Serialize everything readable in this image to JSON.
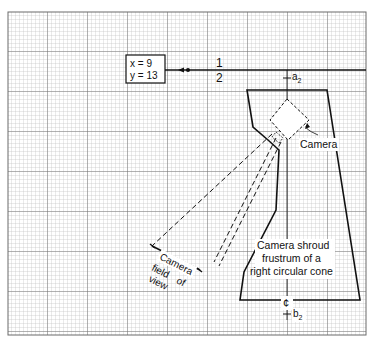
{
  "diagram": {
    "coord_box": {
      "x_label": "x = 9",
      "y_label": "y = 13"
    },
    "fraction": {
      "numerator": "1",
      "denominator": "2"
    },
    "point_a": {
      "letter": "a",
      "subscript": "2"
    },
    "point_b": {
      "letter": "b",
      "subscript": "2"
    },
    "centerline_symbol": "¢",
    "camera_label": "Camera",
    "shroud_label": [
      "Camera shroud",
      "frustrum of a",
      "right circular cone"
    ],
    "fov_label": [
      "Camera",
      "field",
      "of",
      "view"
    ],
    "colors": {
      "grid_minor": "#b8b8b8",
      "grid_major": "#6a6a6a",
      "ink": "#111111",
      "paper": "#ffffff"
    }
  }
}
